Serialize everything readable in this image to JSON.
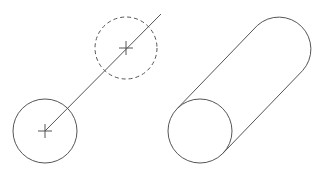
{
  "diagram": {
    "background": "#ffffff",
    "stroke_color": "#555555",
    "left_figure": {
      "description": "circle translated along a path",
      "start_circle": {
        "cx": 45,
        "cy": 131,
        "r": 32,
        "style": "solid"
      },
      "end_circle": {
        "cx": 126,
        "cy": 48,
        "r": 31,
        "style": "dashed"
      },
      "path_line": {
        "x1": 45,
        "y1": 131,
        "x2": 161,
        "y2": 14
      }
    },
    "right_figure": {
      "description": "extruded cylinder",
      "front_circle": {
        "cx": 200,
        "cy": 131,
        "r": 32
      },
      "back_arc_center": {
        "cx": 280,
        "cy": 48,
        "r": 32
      }
    }
  }
}
